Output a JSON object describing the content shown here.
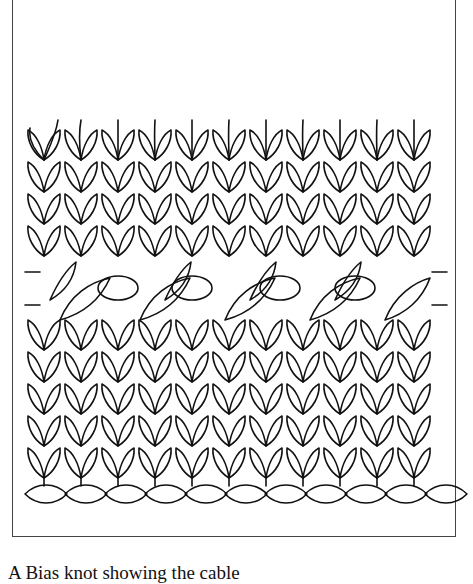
{
  "illustration": {
    "subject": "knitted-fabric-diagram",
    "stitch_columns": 11,
    "stitch_rows_upper": 4,
    "stitch_rows_lower": 5,
    "cable_band_label": "cable-and-eyelet-row",
    "cast_on_twists": 11,
    "line_color": "#111111",
    "frame_color": "#444444"
  },
  "caption": {
    "text": "A Bias knot showing the cable"
  }
}
